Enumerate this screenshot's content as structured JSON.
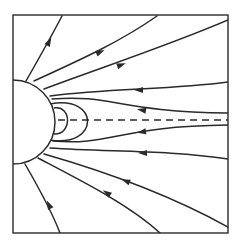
{
  "figure": {
    "type": "field-line-diagram",
    "colors": {
      "line": "#2a2a2a",
      "background": "#ffffff"
    }
  },
  "frame": {
    "x": 13,
    "y": 15,
    "width": 215,
    "height": 218
  },
  "planet": {
    "cx": 13,
    "cy": 122,
    "r": 42
  },
  "neutral_sheet": {
    "x1": 58,
    "y1": 120,
    "x2": 228,
    "y2": 120,
    "style": "dashed"
  },
  "closed_loops": [
    {
      "name": "inner-loop",
      "path": "M 54 108 C 72 105, 72 135, 54 134"
    },
    {
      "name": "outer-loop",
      "path": "M 50 104 C 100 94, 100 148, 50 140"
    }
  ],
  "field_lines": [
    {
      "name": "line-1",
      "path": "M 26 81 C 38 60, 52 35, 62 16",
      "arrow": {
        "x": 49,
        "y": 42,
        "angle": -62
      }
    },
    {
      "name": "line-2",
      "path": "M 34 81 C 80 60, 120 42, 157 16",
      "arrow": {
        "x": 100,
        "y": 52,
        "angle": -25
      }
    },
    {
      "name": "line-3",
      "path": "M 44 89 C 100 68, 170 45, 228 20",
      "arrow": {
        "x": 121,
        "y": 65,
        "angle": -20
      }
    },
    {
      "name": "line-4",
      "path": "M 50 96 C 110 88, 170 90, 228 82",
      "arrow": {
        "x": 139,
        "y": 90,
        "angle": 180
      }
    },
    {
      "name": "line-5",
      "path": "M 52 99 C 110 94, 120 112, 228 113",
      "arrow": {
        "x": 142,
        "y": 110,
        "angle": 190
      }
    },
    {
      "name": "line-6",
      "path": "M 53 141 C 110 146, 120 126, 228 125",
      "arrow": {
        "x": 142,
        "y": 132,
        "angle": 170
      }
    },
    {
      "name": "line-7",
      "path": "M 50 148 C 110 152, 170 150, 228 159",
      "arrow": {
        "x": 143,
        "y": 153,
        "angle": 180
      }
    },
    {
      "name": "line-8",
      "path": "M 44 154 C 100 170, 170 195, 228 227",
      "arrow": {
        "x": 126,
        "y": 181,
        "angle": -158
      }
    },
    {
      "name": "line-9",
      "path": "M 38 158 C 80 180, 130 205, 160 233",
      "arrow": {
        "x": 107,
        "y": 193,
        "angle": -145
      }
    },
    {
      "name": "line-10",
      "path": "M 25 164 C 40 190, 52 212, 60 233",
      "arrow": {
        "x": 49,
        "y": 205,
        "angle": -115
      }
    }
  ]
}
